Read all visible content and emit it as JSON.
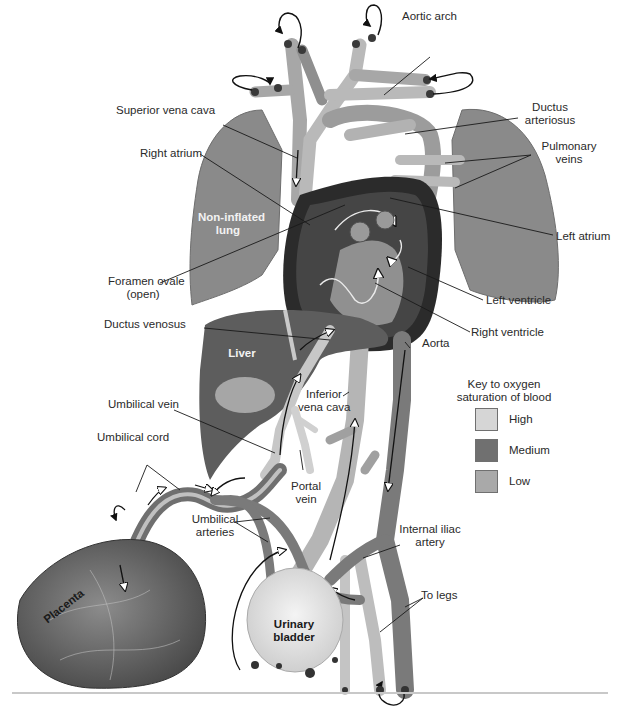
{
  "figure": {
    "colors": {
      "high": "#d6d6d6",
      "medium": "#707070",
      "low": "#a9a9a9",
      "lung": "#8a8a8a",
      "heart_dark": "#2b2b2b",
      "vessel": "#a0a0a0",
      "rule": "#c8c8c8"
    }
  },
  "labels": {
    "aortic_arch": "Aortic arch",
    "superior_vena_cava": "Superior vena cava",
    "ductus_arteriosus_1": "Ductus",
    "ductus_arteriosus_2": "arteriosus",
    "right_atrium": "Right atrium",
    "pulmonary_veins_1": "Pulmonary",
    "pulmonary_veins_2": "veins",
    "non_inflated_lung_1": "Non-inflated",
    "non_inflated_lung_2": "lung",
    "left_atrium": "Left atrium",
    "foramen_ovale_1": "Foramen ovale",
    "foramen_ovale_2": "(open)",
    "left_ventricle": "Left ventricle",
    "ductus_venosus": "Ductus venosus",
    "right_ventricle": "Right ventricle",
    "aorta": "Aorta",
    "liver": "Liver",
    "umbilical_vein": "Umbilical vein",
    "inferior_vena_cava_1": "Inferior",
    "inferior_vena_cava_2": "vena cava",
    "umbilical_cord": "Umbilical cord",
    "portal_vein_1": "Portal",
    "portal_vein_2": "vein",
    "umbilical_arteries_1": "Umbilical",
    "umbilical_arteries_2": "arteries",
    "internal_iliac_artery_1": "Internal iliac",
    "internal_iliac_artery_2": "artery",
    "placenta": "Placenta",
    "to_legs": "To legs",
    "urinary_bladder_1": "Urinary",
    "urinary_bladder_2": "bladder"
  },
  "key": {
    "title_1": "Key to oxygen",
    "title_2": "saturation of blood",
    "items": [
      {
        "label": "High",
        "color": "#d6d6d6"
      },
      {
        "label": "Medium",
        "color": "#707070"
      },
      {
        "label": "Low",
        "color": "#a9a9a9"
      }
    ]
  }
}
